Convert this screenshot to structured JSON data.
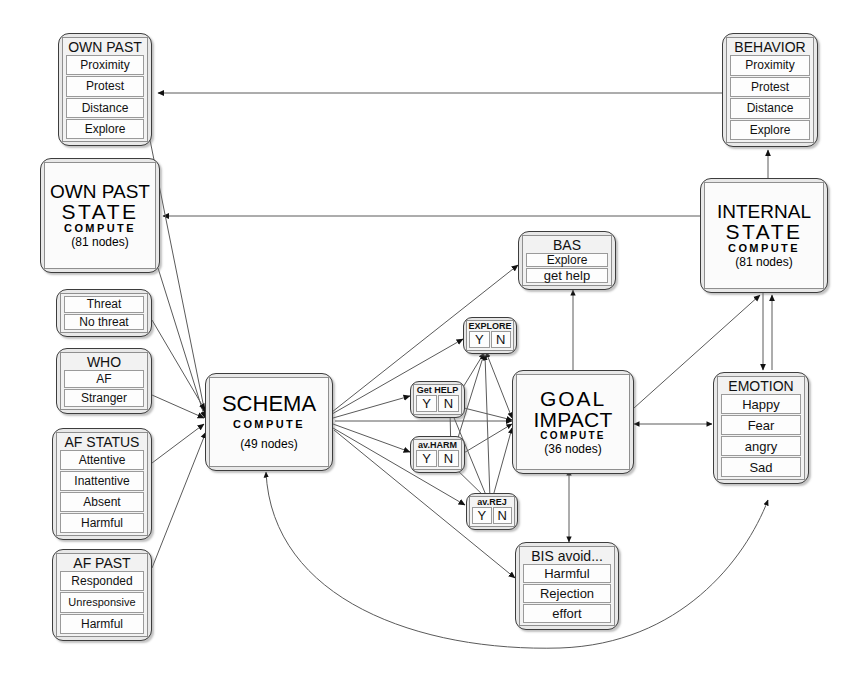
{
  "diagram": {
    "nodes": {
      "own_past": {
        "title": "OWN PAST",
        "rows": [
          "Proximity",
          "Protest",
          "Distance",
          "Explore"
        ]
      },
      "own_past_state": {
        "l1": "OWN PAST",
        "l2": "STATE",
        "l3": "COMPUTE",
        "l4": "(81 nodes)"
      },
      "threat": {
        "title": "",
        "rows": [
          "Threat",
          "No threat"
        ]
      },
      "who": {
        "title": "WHO",
        "rows": [
          "AF",
          "Stranger"
        ]
      },
      "af_status": {
        "title": "AF STATUS",
        "rows": [
          "Attentive",
          "Inattentive",
          "Absent",
          "Harmful"
        ]
      },
      "af_past": {
        "title": "AF PAST",
        "rows": [
          "Responded",
          "Unresponsive",
          "Harmful"
        ]
      },
      "schema": {
        "l1": "SCHEMA",
        "l3": "COMPUTE",
        "l4": "(49 nodes)"
      },
      "bas": {
        "title": "BAS",
        "rows": [
          "Explore",
          "get help"
        ]
      },
      "explore_yn": {
        "cap": "EXPLORE",
        "cells": [
          "Y",
          "N"
        ]
      },
      "get_help_yn": {
        "cap": "Get HELP",
        "cells": [
          "Y",
          "N"
        ]
      },
      "av_harm_yn": {
        "cap": "av.HARM",
        "cells": [
          "Y",
          "N"
        ]
      },
      "av_rej_yn": {
        "cap": "av.REJ",
        "cells": [
          "Y",
          "N"
        ]
      },
      "goal_impact": {
        "l1": "GOAL",
        "l2": "IMPACT",
        "l3": "COMPUTE",
        "l4": "(36 nodes)"
      },
      "bis_avoid": {
        "title": "BIS avoid...",
        "rows": [
          "Harmful",
          "Rejection",
          "effort"
        ]
      },
      "behavior": {
        "title": "BEHAVIOR",
        "rows": [
          "Proximity",
          "Protest",
          "Distance",
          "Explore"
        ]
      },
      "internal_state": {
        "l1": "INTERNAL",
        "l2": "STATE",
        "l3": "COMPUTE",
        "l4": "(81 nodes)"
      },
      "emotion": {
        "title": "EMOTION",
        "rows": [
          "Happy",
          "Fear",
          "angry",
          "Sad"
        ]
      }
    },
    "colors": {
      "ink": "#111111",
      "node_border": "#3d3d3d",
      "node_fill": "#e8e8e8",
      "inner_fill": "#f2f2f2",
      "row_fill": "#fdfdfd",
      "edge": "#5a5a5a",
      "background": "#ffffff"
    }
  }
}
